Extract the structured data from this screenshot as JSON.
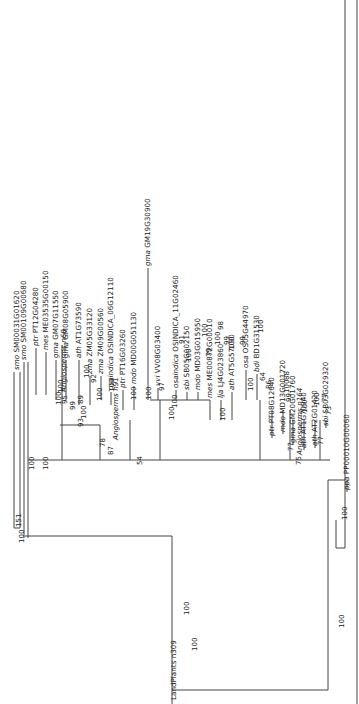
{
  "figure": {
    "type": "phylogenetic-tree",
    "orientation": "rotated-90-ccw",
    "root_label": "LandPlants n309"
  },
  "clades": [
    {
      "name": "Angiosperms n68"
    },
    {
      "name": "Angiosperms n91"
    },
    {
      "name": "Angiosperms n164"
    },
    {
      "name": "LandPlants n309"
    }
  ],
  "taxa": [
    {
      "species": "smo",
      "gene": "SM00031G01620",
      "x": 17,
      "y": 372
    },
    {
      "species": "smo",
      "gene": "SM00109G00680",
      "x": 24,
      "y": 362
    },
    {
      "species": "ptr",
      "gene": "PT12G04280",
      "x": 36,
      "y": 348
    },
    {
      "species": "mes",
      "gene": "ME03535G00150",
      "x": 46,
      "y": 352
    },
    {
      "species": "gma",
      "gene": "GM07G11550",
      "x": 56,
      "y": 360
    },
    {
      "species": "gma",
      "gene": "GM08G05900",
      "x": 66,
      "y": 360
    },
    {
      "species": "ath",
      "gene": "AT1G73590",
      "x": 79,
      "y": 360
    },
    {
      "species": "zma",
      "gene": "ZM05G33120",
      "x": 90,
      "y": 376
    },
    {
      "species": "zma",
      "gene": "ZM09G00560",
      "x": 101,
      "y": 376
    },
    {
      "species": "osaindica",
      "gene": "OSINDICA_06G12110",
      "x": 111,
      "y": 392
    },
    {
      "species": "ptr",
      "gene": "PT16G03260",
      "x": 123,
      "y": 390
    },
    {
      "species": "mdo",
      "gene": "MD00G051130",
      "x": 134,
      "y": 386
    },
    {
      "species": "vvi",
      "gene": "VV08G03400",
      "x": 158,
      "y": 388
    },
    {
      "species": "gma",
      "gene": "GM19G30900",
      "x": 148,
      "y": 268
    },
    {
      "species": "osaindica",
      "gene": "OSINDICA_11G02460",
      "x": 176,
      "y": 390
    },
    {
      "species": "sbi",
      "gene": "SB05G002150",
      "x": 187,
      "y": 392
    },
    {
      "species": "mdo",
      "gene": "MD03G015950",
      "x": 198,
      "y": 392
    },
    {
      "species": "mes",
      "gene": "ME00872G00010",
      "x": 210,
      "y": 400
    },
    {
      "species": "lja",
      "gene": "LJ4G023860",
      "x": 221,
      "y": 400
    },
    {
      "species": "ath",
      "gene": "AT5G57090",
      "x": 232,
      "y": 392
    },
    {
      "species": "osa",
      "gene": "OS05G44970",
      "x": 246,
      "y": 370
    },
    {
      "species": "bdi",
      "gene": "BD1G31530",
      "x": 257,
      "y": 374
    },
    {
      "species": "ptr",
      "gene": "PT08G12640",
      "x": 272,
      "y": 438
    },
    {
      "species": "mdo",
      "gene": "MD13G001720",
      "x": 283,
      "y": 434
    },
    {
      "species": "gma",
      "gene": "GM20G01760",
      "x": 293,
      "y": 445
    },
    {
      "species": "ath",
      "gene": "AT1G70940",
      "x": 304,
      "y": 450
    },
    {
      "species": "ath",
      "gene": "AT2G01420",
      "x": 315,
      "y": 448
    },
    {
      "species": "sbi",
      "gene": "SB03G029320",
      "x": 326,
      "y": 428
    },
    {
      "species": "ppa",
      "gene": "PP00010G00060",
      "x": 347,
      "y": 492
    }
  ],
  "bootstrap": [
    {
      "v": "100",
      "x": 33,
      "y": 470
    },
    {
      "v": "100",
      "x": 47,
      "y": 470
    },
    {
      "v": "100",
      "x": 60,
      "y": 405
    },
    {
      "v": "100",
      "x": 62,
      "y": 393
    },
    {
      "v": "95",
      "x": 66,
      "y": 404
    },
    {
      "v": "100",
      "x": 85,
      "y": 419
    },
    {
      "v": "100",
      "x": 88,
      "y": 378
    },
    {
      "v": "99",
      "x": 74,
      "y": 410
    },
    {
      "v": "89",
      "x": 82,
      "y": 404
    },
    {
      "v": "93",
      "x": 82,
      "y": 427
    },
    {
      "v": "92",
      "x": 95,
      "y": 383
    },
    {
      "v": "100",
      "x": 101,
      "y": 401
    },
    {
      "v": "100",
      "x": 113,
      "y": 392
    },
    {
      "v": "78",
      "x": 104,
      "y": 447
    },
    {
      "v": "87",
      "x": 112,
      "y": 455
    },
    {
      "v": "100",
      "x": 150,
      "y": 400
    },
    {
      "v": "97",
      "x": 163,
      "y": 391
    },
    {
      "v": "100",
      "x": 176,
      "y": 408
    },
    {
      "v": "91",
      "x": 183,
      "y": 344
    },
    {
      "v": "100",
      "x": 190,
      "y": 362
    },
    {
      "v": "100",
      "x": 206,
      "y": 337
    },
    {
      "v": "79",
      "x": 210,
      "y": 357
    },
    {
      "v": "98",
      "x": 222,
      "y": 330
    },
    {
      "v": "100",
      "x": 219,
      "y": 345
    },
    {
      "v": "99",
      "x": 228,
      "y": 345
    },
    {
      "v": "100",
      "x": 233,
      "y": 350
    },
    {
      "v": "99",
      "x": 244,
      "y": 345
    },
    {
      "v": "100",
      "x": 262,
      "y": 333
    },
    {
      "v": "100",
      "x": 252,
      "y": 391
    },
    {
      "v": "100",
      "x": 224,
      "y": 421
    },
    {
      "v": "100",
      "x": 173,
      "y": 420
    },
    {
      "v": "100",
      "x": 135,
      "y": 400
    },
    {
      "v": "54",
      "x": 141,
      "y": 465
    },
    {
      "v": "64",
      "x": 264,
      "y": 381
    },
    {
      "v": "86",
      "x": 270,
      "y": 389
    },
    {
      "v": "88",
      "x": 288,
      "y": 380
    },
    {
      "v": "100",
      "x": 288,
      "y": 393
    },
    {
      "v": "99",
      "x": 290,
      "y": 402
    },
    {
      "v": "100",
      "x": 306,
      "y": 413
    },
    {
      "v": "100",
      "x": 318,
      "y": 406
    },
    {
      "v": "77",
      "x": 326,
      "y": 402
    },
    {
      "v": "73",
      "x": 330,
      "y": 415
    },
    {
      "v": "77",
      "x": 292,
      "y": 451
    },
    {
      "v": "75",
      "x": 300,
      "y": 465
    },
    {
      "v": "77",
      "x": 322,
      "y": 445
    },
    {
      "v": "100",
      "x": 346,
      "y": 520
    },
    {
      "v": "100",
      "x": 343,
      "y": 628
    },
    {
      "v": "100",
      "x": 188,
      "y": 615
    },
    {
      "v": "100",
      "x": 196,
      "y": 651
    },
    {
      "v": "151",
      "x": 20,
      "y": 527
    },
    {
      "v": "100",
      "x": 23,
      "y": 543
    }
  ]
}
